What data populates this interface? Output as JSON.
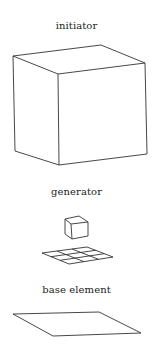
{
  "labels": {
    "initiator": "initiator",
    "generator": "generator",
    "base_element": "base element"
  },
  "colors": {
    "line": "#333333",
    "text": "#222222",
    "background": "#ffffff"
  }
}
